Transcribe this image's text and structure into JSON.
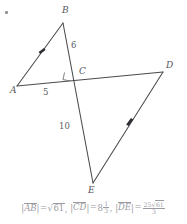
{
  "figure": {
    "corner_mark": "•",
    "vertices": [
      {
        "key": "A",
        "label": "A",
        "x": 17,
        "y": 86
      },
      {
        "key": "B",
        "label": "B",
        "x": 63,
        "y": 23
      },
      {
        "key": "C",
        "label": "C",
        "x": 76,
        "y": 78
      },
      {
        "key": "D",
        "label": "D",
        "x": 163,
        "y": 72
      },
      {
        "key": "E",
        "label": "E",
        "x": 93,
        "y": 183
      }
    ],
    "vertex_labels": [
      {
        "name": "vertex-label-a",
        "text": "A",
        "x": 10,
        "y": 91
      },
      {
        "name": "vertex-label-b",
        "text": "B",
        "x": 62,
        "y": 9
      },
      {
        "name": "vertex-label-c",
        "text": "C",
        "x": 79,
        "y": 71
      },
      {
        "name": "vertex-label-d",
        "text": "D",
        "x": 166,
        "y": 65
      },
      {
        "name": "vertex-label-e",
        "text": "E",
        "x": 89,
        "y": 188
      }
    ],
    "measures": [
      {
        "name": "measure-bc",
        "text": "6",
        "x": 72,
        "y": 44
      },
      {
        "name": "measure-ac",
        "text": "5",
        "x": 44,
        "y": 91
      },
      {
        "name": "measure-ce",
        "text": "10",
        "x": 62,
        "y": 124
      }
    ],
    "segments": [
      {
        "name": "segment-ab",
        "from": "A",
        "to": "B"
      },
      {
        "name": "segment-be",
        "from": "B",
        "to": "E"
      },
      {
        "name": "segment-ad",
        "from": "A",
        "to": "D"
      },
      {
        "name": "segment-de",
        "from": "D",
        "to": "E"
      }
    ],
    "parallel_marks": [
      {
        "name": "arrow-marker-ab",
        "on": "segment-ab"
      },
      {
        "name": "arrow-marker-de",
        "on": "segment-de"
      }
    ],
    "right_angle": {
      "name": "right-angle-marker-c",
      "at": "C"
    }
  },
  "answer": {
    "ab_label": "AB",
    "ab_eq": "=",
    "ab_radicand": "61",
    "comma": ",",
    "cd_label": "CD",
    "cd_eq": "=",
    "cd_int": "8",
    "cd_num": "1",
    "cd_den": "3",
    "de_label": "DE",
    "de_eq": "=",
    "de_num_radicand": "61",
    "de_num_coeff": "25",
    "de_den": "3"
  },
  "colors": {
    "stroke": "#4a4a4f",
    "label": "#55555c",
    "answer_text": "#9a9aa2",
    "background": "#ffffff"
  }
}
